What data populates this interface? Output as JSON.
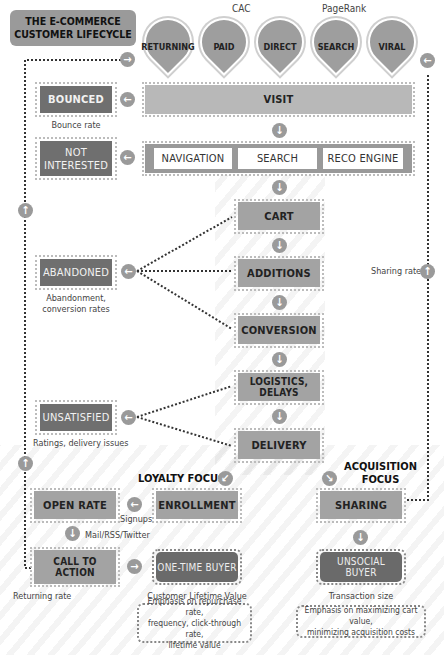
{
  "title": {
    "line1": "THE E-COMMERCE",
    "line2": "CUSTOMER LIFECYCLE"
  },
  "channel_labels": {
    "cac": "CAC",
    "pagerank": "PageRank"
  },
  "channels": [
    {
      "label": "RETURNING"
    },
    {
      "label": "PAID"
    },
    {
      "label": "DIRECT"
    },
    {
      "label": "SEARCH"
    },
    {
      "label": "VIRAL"
    }
  ],
  "funnel": {
    "visit": "VISIT",
    "discovery": [
      "NAVIGATION",
      "SEARCH",
      "RECO ENGINE"
    ],
    "cart": "CART",
    "additions": "ADDITIONS",
    "conversion": "CONVERSION",
    "logistics": "LOGISTICS, DELAYS",
    "delivery": "DELIVERY"
  },
  "exits": {
    "bounced": {
      "label": "BOUNCED",
      "metric": "Bounce rate"
    },
    "not_interested": {
      "label_line1": "NOT",
      "label_line2": "INTERESTED"
    },
    "abandoned": {
      "label": "ABANDONED",
      "metric_line1": "Abandonment,",
      "metric_line2": "conversion rates"
    },
    "unsatisfied": {
      "label": "UNSATISFIED",
      "metric": "Ratings, delivery issues"
    }
  },
  "loyalty": {
    "heading": "LOYALTY FOCUS",
    "enrollment": "ENROLLMENT",
    "signups": "Signups",
    "open_rate": "OPEN RATE",
    "channels_note": "Mail/RSS/Twitter",
    "call_to_action": "CALL TO ACTION",
    "returning_rate": "Returning rate",
    "one_time_buyer": "ONE-TIME BUYER",
    "clv": "Customer Lifetime Value",
    "emphasis_line1": "Emphasis on repurchase rate,",
    "emphasis_line2": "frequency, click-through rate,",
    "emphasis_line3": "lifetime value"
  },
  "acquisition": {
    "heading_line1": "ACQUISITION",
    "heading_line2": "FOCUS",
    "sharing": "SHARING",
    "sharing_rate": "Sharing rate",
    "unsocial_buyer": "UNSOCIAL BUYER",
    "transaction_size": "Transaction size",
    "emphasis_line1": "Emphasis on maximizing cart value,",
    "emphasis_line2": "minimizing acquisition costs"
  },
  "icons": {
    "arrow_left": "←",
    "arrow_right": "→",
    "arrow_down": "↓",
    "arrow_up": "↑",
    "arrow_down_left": "↙",
    "arrow_down_right": "↘"
  },
  "colors": {
    "light_box": "#a3a3a3",
    "dark_box": "#6f6f6f",
    "arrow_circle": "#9a9a9a"
  }
}
